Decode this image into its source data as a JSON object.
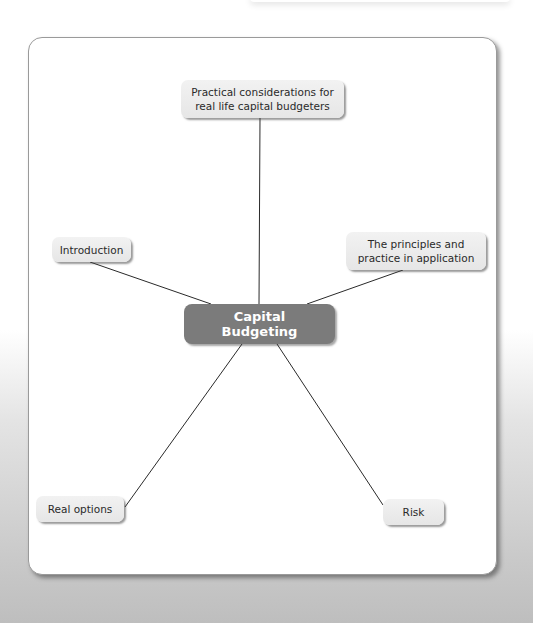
{
  "diagram": {
    "center": {
      "line1": "Capital",
      "line2": "Budgeting"
    },
    "nodes": {
      "practical": {
        "line1": "Practical considerations for",
        "line2": "real life capital budgeters"
      },
      "introduction": {
        "label": "Introduction"
      },
      "principles": {
        "line1": "The principles and",
        "line2": "practice in application"
      },
      "real_options": {
        "label": "Real options"
      },
      "risk": {
        "label": "Risk"
      }
    },
    "colors": {
      "center_fill": "#7b7b7b",
      "node_fill": "#ececec",
      "line": "#2a2a2a"
    }
  }
}
